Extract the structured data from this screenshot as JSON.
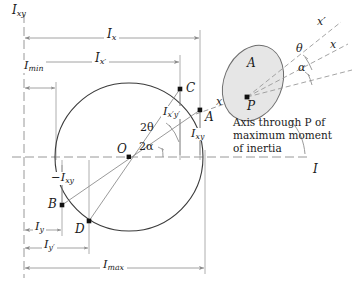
{
  "diagram": {
    "axes": {
      "horizontal_label": "I",
      "vertical_label": "I",
      "vertical_label_sub": "xy"
    },
    "colors": {
      "line": "#3b3b3b",
      "dim_line": "#8c8c8c",
      "axis_dash": "#8c8c8c",
      "point_fill": "#111111",
      "blob_fill": "#e4e4e4",
      "blob_stroke": "#6d6d6d",
      "text": "#1a1a1a"
    },
    "points": [
      {
        "name": "O",
        "label": "O",
        "sub": "",
        "x": 129,
        "y": 157
      },
      {
        "name": "A",
        "label": "A",
        "sub": "",
        "x": 200,
        "y": 110
      },
      {
        "name": "B",
        "label": "B",
        "sub": "",
        "x": 62,
        "y": 205
      },
      {
        "name": "C",
        "label": "C",
        "sub": "",
        "x": 180,
        "y": 89
      },
      {
        "name": "D",
        "label": "D",
        "sub": "",
        "x": 89,
        "y": 221
      }
    ],
    "labels": {
      "axis_vertical": "I",
      "axis_vertical_sub": "xy",
      "axis_horizontal": "I",
      "Ix": "I",
      "Ix_sub": "x",
      "Ixp": "I",
      "Ixp_sub": "x′",
      "Imin": "I",
      "Imin_sub": "min",
      "Imax": "I",
      "Imax_sub": "max",
      "Iy": "I",
      "Iy_sub": "y",
      "Iyp": "I",
      "Iyp_sub": "y′",
      "Ixy": "I",
      "Ixy_sub": "xy",
      "Ixy_neg": "−I",
      "Ixy_neg_sub": "xy",
      "Ixpyp": "I",
      "Ixpyp_sub": "x′y′",
      "two_theta": "2θ",
      "two_alpha": "2α",
      "theta": "θ",
      "alpha": "α",
      "point_O": "O",
      "point_A": "A",
      "point_B": "B",
      "point_C": "C",
      "point_D": "D",
      "area_A": "A",
      "point_P": "P",
      "axis_x": "x",
      "axis_xp": "x′",
      "axis_x_inset": "x",
      "axis_xp_inset": "x′"
    },
    "caption": {
      "line1": "Axis through P of",
      "line2": "maximum moment",
      "line3": "of inertia",
      "full": "Axis through P of maximum moment of inertia"
    },
    "dimensions": [
      {
        "name": "Ix",
        "label": "I",
        "sub": "x",
        "from_x": 24,
        "to_x": 200,
        "y": 38
      },
      {
        "name": "Ixp",
        "label": "I",
        "sub": "x′",
        "from_x": 24,
        "to_x": 180,
        "y": 62
      },
      {
        "name": "Imin",
        "label": "I",
        "sub": "min",
        "from_x": 24,
        "to_x": 56,
        "y": 88
      },
      {
        "name": "Iy",
        "label": "I",
        "sub": "y",
        "from_x": 24,
        "to_x": 62,
        "y": 230
      },
      {
        "name": "Iyp",
        "label": "I",
        "sub": "y′",
        "from_x": 24,
        "to_x": 89,
        "y": 248
      },
      {
        "name": "Imax",
        "label": "I",
        "sub": "max",
        "from_x": 24,
        "to_x": 205,
        "y": 268
      }
    ],
    "circle": {
      "cx": 129,
      "cy": 157,
      "r": 74
    },
    "inset": {
      "blob_cx": 253,
      "blob_cy": 83,
      "blob_rx": 30,
      "blob_ry": 40,
      "blob_rot": 22,
      "point_P_x": 247,
      "point_P_y": 97
    }
  }
}
